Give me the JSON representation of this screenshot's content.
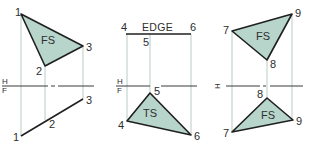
{
  "figure": {
    "colors": {
      "face_fill": "#b7d5cb",
      "outline": "#1f1f1f",
      "projection_line": "#b9cbc5",
      "fold_line": "#3a3a3a",
      "text": "#2e2e2e"
    },
    "fold_label_top": "H",
    "fold_label_bottom": "F",
    "views": [
      {
        "id": "view-a",
        "top": {
          "face_label": "FS",
          "points": [
            {
              "label": "1"
            },
            {
              "label": "2"
            },
            {
              "label": "3"
            }
          ]
        },
        "front": {
          "kind": "edge-line",
          "points": [
            {
              "label": "1"
            },
            {
              "label": "2"
            },
            {
              "label": "3"
            }
          ]
        }
      },
      {
        "id": "view-b",
        "top": {
          "kind": "edge-line",
          "edge_label": "EDGE",
          "points": [
            {
              "label": "4"
            },
            {
              "label": "5"
            },
            {
              "label": "6"
            }
          ]
        },
        "front": {
          "face_label": "TS",
          "points": [
            {
              "label": "4"
            },
            {
              "label": "5"
            },
            {
              "label": "6"
            }
          ]
        }
      },
      {
        "id": "view-c",
        "top": {
          "face_label": "FS",
          "points": [
            {
              "label": "7"
            },
            {
              "label": "8"
            },
            {
              "label": "9"
            }
          ]
        },
        "front": {
          "face_label": "FS",
          "points": [
            {
              "label": "7"
            },
            {
              "label": "8"
            },
            {
              "label": "9"
            }
          ]
        }
      }
    ]
  }
}
